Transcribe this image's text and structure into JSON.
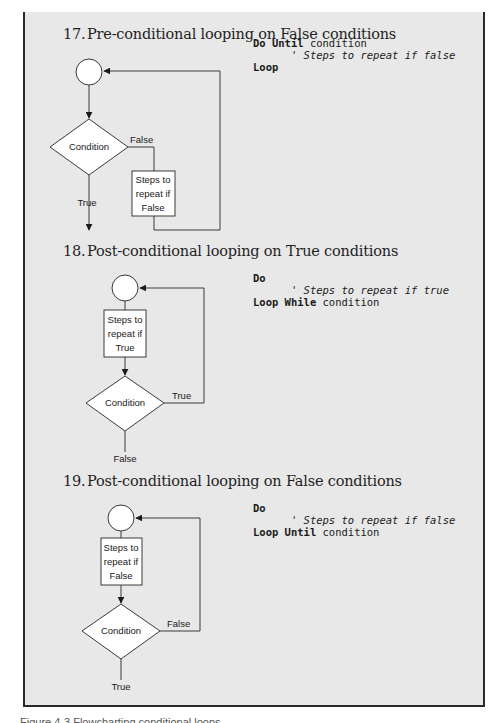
{
  "sections": [
    {
      "number": "17.",
      "title": "Pre-conditional looping on False conditions",
      "code": {
        "line1_kw": "Do Until",
        "line1_rest": " condition",
        "line2_comment": "      ' Steps to repeat if false",
        "line3_kw": "Loop",
        "line3_rest": ""
      },
      "flow": {
        "decision_label": "Condition",
        "branch_label": "False",
        "exit_label": "True",
        "process_lines": [
          "Steps to",
          "repeat if",
          "False"
        ]
      }
    },
    {
      "number": "18.",
      "title": "Post-conditional looping on True conditions",
      "code": {
        "line1_kw": "Do",
        "line1_rest": "",
        "line2_comment": "      ' Steps to repeat if true",
        "line3_kw": "Loop While",
        "line3_rest": " condition"
      },
      "flow": {
        "decision_label": "Condition",
        "branch_label": "True",
        "exit_label": "False",
        "process_lines": [
          "Steps to",
          "repeat if",
          "True"
        ]
      }
    },
    {
      "number": "19.",
      "title": "Post-conditional looping on False conditions",
      "code": {
        "line1_kw": "Do",
        "line1_rest": "",
        "line2_comment": "      ' Steps to repeat if false",
        "line3_kw": "Loop Until",
        "line3_rest": " condition"
      },
      "flow": {
        "decision_label": "Condition",
        "branch_label": "False",
        "exit_label": "True",
        "process_lines": [
          "Steps to",
          "repeat if",
          "False"
        ]
      }
    }
  ],
  "colors": {
    "panel_bg": "#e8e8e8",
    "shape_fill": "#ffffff",
    "line": "#3a3a3a"
  },
  "caption_partial": "Figure 4-3  Flowcharting conditional loops"
}
